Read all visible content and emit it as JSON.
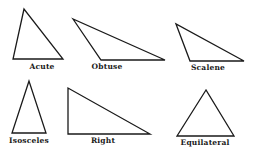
{
  "diagram": {
    "stroke_color": "#1a1a1a",
    "background": "#ffffff",
    "triangles": [
      {
        "label": "Acute",
        "points": "24,9 13,59 63,59",
        "label_pos": [
          42,
          63
        ]
      },
      {
        "label": "Obtuse",
        "points": "73,19 101,60 165,60",
        "label_pos": [
          104,
          63
        ]
      },
      {
        "label": "Scalene",
        "points": "176,24 190,61 244,61",
        "label_pos": [
          211,
          64
        ]
      },
      {
        "label": "Isosceles",
        "points": "29,81 12,133 46,133",
        "label_pos": [
          29,
          137
        ]
      },
      {
        "label": "Right",
        "points": "68,88 68,134 150,134",
        "label_pos": [
          103,
          137
        ]
      },
      {
        "label": "Equilateral",
        "points": "206,90 177,136 234,136",
        "label_pos": [
          205,
          139
        ]
      }
    ]
  }
}
